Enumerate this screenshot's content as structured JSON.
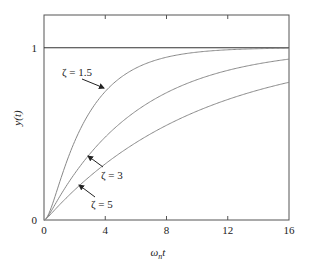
{
  "chart_data": {
    "type": "line",
    "title": "",
    "xlabel": "ω_n t",
    "xlabel_main": "ω",
    "xlabel_sub": "n",
    "xlabel_tail": "t",
    "ylabel": "y(t)",
    "xlim": [
      0,
      16
    ],
    "ylim": [
      0,
      1.19
    ],
    "x_ticks": [
      0,
      4,
      8,
      12,
      16
    ],
    "x_tick_labels": [
      "0",
      "4",
      "8",
      "12",
      "16"
    ],
    "y_ticks": [
      0,
      1
    ],
    "y_tick_labels": [
      "0",
      "1"
    ],
    "reference_line": {
      "y": 1
    },
    "grid": false,
    "legend": null,
    "x": [
      0,
      1,
      2,
      3,
      4,
      5,
      6,
      7,
      8,
      9,
      10,
      12,
      14,
      16
    ],
    "series": [
      {
        "name": "ζ = 1.5",
        "zeta": 1.5,
        "values": [
          0,
          0.213,
          0.455,
          0.628,
          0.746,
          0.827,
          0.882,
          0.919,
          0.945,
          0.962,
          0.974,
          0.988,
          0.994,
          0.997
        ]
      },
      {
        "name": "ζ = 3",
        "zeta": 3,
        "values": [
          0,
          0.132,
          0.269,
          0.384,
          0.481,
          0.563,
          0.632,
          0.69,
          0.739,
          0.78,
          0.815,
          0.869,
          0.907,
          0.934
        ]
      },
      {
        "name": "ζ = 5",
        "zeta": 5,
        "values": [
          0,
          0.087,
          0.174,
          0.254,
          0.326,
          0.39,
          0.449,
          0.502,
          0.55,
          0.593,
          0.632,
          0.699,
          0.754,
          0.799
        ]
      }
    ],
    "annotations": [
      {
        "text": "ζ = 1.5",
        "series": 0,
        "label_x": 62,
        "label_y": 76,
        "arrow_from": [
          82,
          79
        ],
        "arrow_to": [
          104,
          88
        ]
      },
      {
        "text": "ζ = 3",
        "series": 1,
        "label_x": 101,
        "label_y": 179,
        "arrow_from": [
          103,
          167
        ],
        "arrow_to": [
          88,
          156
        ]
      },
      {
        "text": "ζ = 5",
        "series": 2,
        "label_x": 91,
        "label_y": 208,
        "arrow_from": [
          95,
          197
        ],
        "arrow_to": [
          79,
          185
        ]
      }
    ],
    "colors": {
      "axis": "#555555",
      "curve": "#888888",
      "reference": "#333333",
      "text": "#222222"
    }
  }
}
